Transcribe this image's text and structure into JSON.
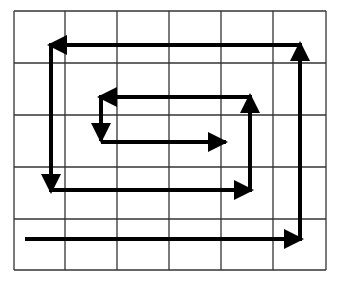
{
  "diagram": {
    "type": "spiral-path-on-grid",
    "grid": {
      "columns": 6,
      "rows": 5,
      "x_lines": [
        14,
        65,
        117,
        169,
        221,
        273,
        326
      ],
      "y_lines": [
        11,
        63,
        115,
        167,
        219,
        270
      ],
      "line_color": "#333333"
    },
    "path_color": "#000000",
    "segments": [
      {
        "from": [
          27,
          239
        ],
        "to": [
          300,
          239
        ],
        "direction": "right"
      },
      {
        "from": [
          300,
          239
        ],
        "to": [
          300,
          45
        ],
        "direction": "up"
      },
      {
        "from": [
          300,
          45
        ],
        "to": [
          51,
          45
        ],
        "direction": "left"
      },
      {
        "from": [
          51,
          45
        ],
        "to": [
          51,
          190
        ],
        "direction": "down"
      },
      {
        "from": [
          51,
          190
        ],
        "to": [
          250,
          190
        ],
        "direction": "right"
      },
      {
        "from": [
          250,
          190
        ],
        "to": [
          250,
          97
        ],
        "direction": "up"
      },
      {
        "from": [
          250,
          97
        ],
        "to": [
          101,
          97
        ],
        "direction": "left"
      },
      {
        "from": [
          101,
          97
        ],
        "to": [
          101,
          139
        ],
        "direction": "down"
      },
      {
        "from": [
          103,
          142
        ],
        "to": [
          224,
          142
        ],
        "direction": "right"
      }
    ]
  }
}
